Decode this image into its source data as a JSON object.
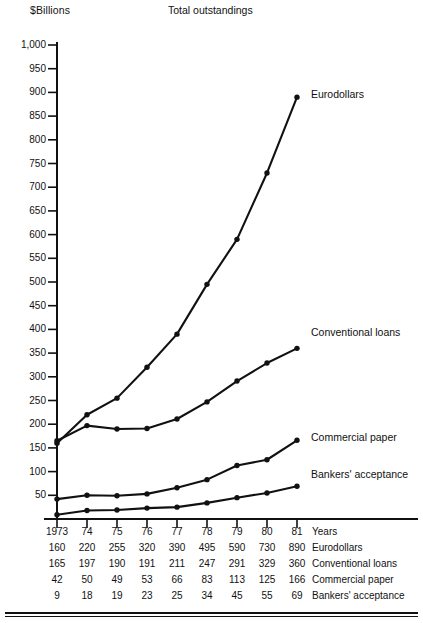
{
  "chart_data": {
    "type": "line",
    "title": "Total outstandings",
    "ylabel": "$Billions",
    "xlabel": "Years",
    "grid": false,
    "legend_position": "right-inline-callouts",
    "x": [
      "1973",
      "74",
      "75",
      "76",
      "77",
      "78",
      "79",
      "80",
      "81"
    ],
    "categories": [
      "1973",
      "74",
      "75",
      "76",
      "77",
      "78",
      "79",
      "80",
      "81"
    ],
    "ylim": [
      0,
      1000
    ],
    "ytick_labels": [
      "1,000",
      "950",
      "900",
      "850",
      "800",
      "750",
      "700",
      "650",
      "600",
      "550",
      "500",
      "450",
      "400",
      "350",
      "300",
      "250",
      "200",
      "150",
      "100",
      "50"
    ],
    "ytick_values": [
      1000,
      950,
      900,
      850,
      800,
      750,
      700,
      650,
      600,
      550,
      500,
      450,
      400,
      350,
      300,
      250,
      200,
      150,
      100,
      50
    ],
    "series": [
      {
        "name": "Eurodollars",
        "values": [
          160,
          220,
          255,
          320,
          390,
          495,
          590,
          730,
          890
        ]
      },
      {
        "name": "Conventional loans",
        "values": [
          165,
          197,
          190,
          191,
          211,
          247,
          291,
          329,
          360
        ]
      },
      {
        "name": "Commercial paper",
        "values": [
          42,
          50,
          49,
          53,
          66,
          83,
          113,
          125,
          166
        ]
      },
      {
        "name": "Bankers' acceptance",
        "values": [
          9,
          18,
          19,
          23,
          25,
          34,
          45,
          55,
          69
        ]
      }
    ]
  },
  "header": {
    "unit_label": "$Billions",
    "title": "Total outstandings"
  },
  "callouts": {
    "eurodollars": "Eurodollars",
    "conventional_loans": "Conventional loans",
    "commercial_paper": "Commercial paper",
    "bankers_acceptance": "Bankers' acceptance"
  },
  "table": {
    "row_years": {
      "name": "Years",
      "values": [
        "1973",
        "74",
        "75",
        "76",
        "77",
        "78",
        "79",
        "80",
        "81"
      ]
    },
    "row_euro": {
      "name": "Eurodollars",
      "values": [
        "160",
        "220",
        "255",
        "320",
        "390",
        "495",
        "590",
        "730",
        "890"
      ]
    },
    "row_conv": {
      "name": "Conventional loans",
      "values": [
        "165",
        "197",
        "190",
        "191",
        "211",
        "247",
        "291",
        "329",
        "360"
      ]
    },
    "row_paper": {
      "name": "Commercial paper",
      "values": [
        "42",
        "50",
        "49",
        "53",
        "66",
        "83",
        "113",
        "125",
        "166"
      ]
    },
    "row_bankers": {
      "name": "Bankers' acceptance",
      "values": [
        "9",
        "18",
        "19",
        "23",
        "25",
        "34",
        "45",
        "55",
        "69"
      ]
    }
  },
  "colors": {
    "ink": "#111111",
    "background": "#ffffff"
  }
}
